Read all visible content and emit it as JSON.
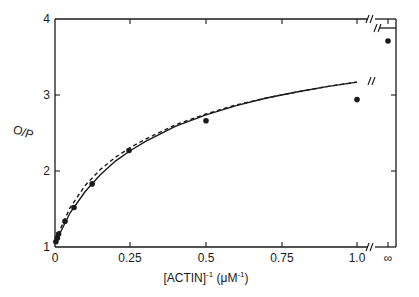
{
  "chart_data": {
    "type": "line",
    "title": "",
    "xlabel": "[ACTIN]-1 (μM-1)",
    "xlabel_parts": {
      "base": "[ACTIN]",
      "exp1": "-1",
      "mid": " (μM",
      "exp2": "-1",
      "end": ")"
    },
    "ylabel": "O/P",
    "xlim": [
      0,
      1.0
    ],
    "ylim": [
      1,
      4
    ],
    "x_ticks": [
      {
        "value": 0,
        "label": "0"
      },
      {
        "value": 0.25,
        "label": "0.25"
      },
      {
        "value": 0.5,
        "label": "0.5"
      },
      {
        "value": 0.75,
        "label": "0.75"
      },
      {
        "value": 1.0,
        "label": "1.0"
      }
    ],
    "x_break_tick": {
      "label": "∞"
    },
    "y_ticks": [
      {
        "value": 1,
        "label": "1"
      },
      {
        "value": 2,
        "label": "2"
      },
      {
        "value": 3,
        "label": "3"
      },
      {
        "value": 4,
        "label": "4"
      }
    ],
    "grid": false,
    "legend": null,
    "axis_break": true,
    "series": [
      {
        "name": "data points",
        "style": "scatter",
        "x": [
          0.003,
          0.008,
          0.012,
          0.033,
          0.063,
          0.123,
          0.245,
          0.5,
          1.0
        ],
        "y": [
          1.07,
          1.12,
          1.17,
          1.34,
          1.52,
          1.83,
          2.27,
          2.66,
          2.94
        ]
      },
      {
        "name": "data point at infinity",
        "style": "scatter",
        "x": [
          "∞"
        ],
        "y": [
          3.71
        ]
      },
      {
        "name": "fit (solid)",
        "style": "solid-line",
        "x": [
          0,
          0.05,
          0.1,
          0.15,
          0.2,
          0.25,
          0.3,
          0.4,
          0.5,
          0.6,
          0.7,
          0.8,
          0.9,
          1.0
        ],
        "y": [
          1.05,
          1.45,
          1.73,
          1.95,
          2.13,
          2.27,
          2.39,
          2.59,
          2.74,
          2.86,
          2.96,
          3.04,
          3.11,
          3.17
        ]
      },
      {
        "name": "fit (dashed)",
        "style": "dashed-line",
        "x": [
          0,
          0.05,
          0.1,
          0.15,
          0.2,
          0.25,
          0.3,
          0.4,
          0.5,
          0.6,
          0.7,
          0.8,
          0.9,
          1.0
        ],
        "y": [
          1.08,
          1.52,
          1.81,
          2.02,
          2.18,
          2.31,
          2.42,
          2.61,
          2.75,
          2.87,
          2.96,
          3.04,
          3.11,
          3.17
        ]
      }
    ]
  },
  "colors": {
    "ink": "#1a1a1a",
    "background": "#ffffff"
  }
}
